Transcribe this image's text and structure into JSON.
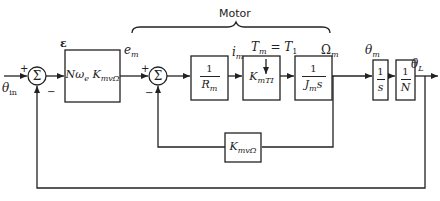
{
  "diagram": {
    "title": "Motor",
    "input_label": "θin",
    "input_label_main": "θ",
    "input_label_sub": "in",
    "error_label": "ε",
    "em_label_main": "e",
    "em_label_sub": "m",
    "im_label_main": "i",
    "im_label_sub": "m",
    "torque_label": "Tm = T1",
    "torque_main": "T",
    "torque_sub": "m",
    "torque_eq": "=",
    "torque_rhs_main": "T",
    "torque_rhs_sub": "1",
    "omega_label_main": "Ω",
    "omega_label_sub": "m",
    "theta_m_main": "θ",
    "theta_m_sub": "m",
    "output_main": "θ",
    "output_sub": "L",
    "summers": [
      {
        "id": "sum1",
        "symbol": "Σ",
        "plus": "+",
        "minus": "−"
      },
      {
        "id": "sum2",
        "symbol": "Σ",
        "plus": "+",
        "minus": "−"
      }
    ],
    "blocks": {
      "amp": {
        "main": "Nω",
        "sub1": "e",
        "k": "K",
        "ksub": "mvΩ"
      },
      "resistance": {
        "num": "1",
        "den_main": "R",
        "den_sub": "m"
      },
      "torque_const": {
        "main": "K",
        "sub": "mTI"
      },
      "inertia": {
        "num": "1",
        "den_main": "J",
        "den_sub": "m",
        "den_s": "s"
      },
      "integrator": {
        "num": "1",
        "den": "s"
      },
      "gear": {
        "num": "1",
        "den": "N"
      },
      "backemf": {
        "main": "K",
        "sub": "mvΩ"
      }
    }
  }
}
